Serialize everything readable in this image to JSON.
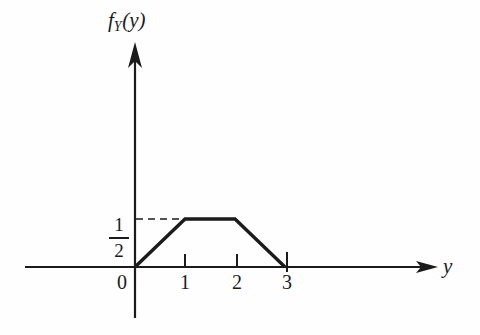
{
  "figure": {
    "background_color": "#fefefe",
    "ink_color": "#1b1b1b",
    "axis_titles": {
      "vertical_function": "f",
      "vertical_subscript": "Y",
      "vertical_argument": "(y)",
      "horizontal": "y"
    },
    "y_tick": {
      "numerator": "1",
      "denominator": "2"
    },
    "x_tick_labels": [
      "0",
      "1",
      "2",
      "3"
    ]
  },
  "chart_data": {
    "type": "line",
    "title": "",
    "subtitle": "",
    "xlabel": "y",
    "ylabel": "f_Y(y)",
    "annotations": [
      "dashed guide line from 1/2 on vertical axis to the plateau"
    ],
    "legend": [],
    "legend_position": "none",
    "grid": false,
    "xlim": [
      0,
      3.6
    ],
    "ylim": [
      0,
      0.95
    ],
    "xticks": [
      0,
      1,
      2,
      3
    ],
    "xticklabels": [
      "0",
      "1",
      "2",
      "3"
    ],
    "yticks": [
      0.5
    ],
    "yticklabels": [
      "1/2"
    ],
    "series": [
      {
        "name": "f_Y(y)",
        "x": [
          0,
          1,
          2,
          3
        ],
        "values": [
          0,
          0.5,
          0.5,
          0
        ]
      }
    ]
  }
}
